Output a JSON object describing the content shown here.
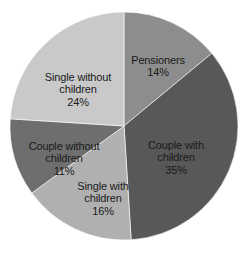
{
  "chart_data": {
    "type": "pie",
    "title": "",
    "subtitle": "",
    "xlabel": "",
    "ylabel": "",
    "legend": "none (labels placed on slices)",
    "grid": false,
    "units": "percent",
    "total": 100,
    "start_angle_deg": 0,
    "direction": "clockwise",
    "categories": [
      "Pensioners",
      "Couple with children",
      "Single with children",
      "Couple without children",
      "Single without children"
    ],
    "values": [
      14,
      35,
      16,
      11,
      24
    ],
    "slices": [
      {
        "label": "Pensioners",
        "value": 14,
        "value_text": "14%",
        "color": "#8d8d8d",
        "start_deg": 0,
        "end_deg": 50.4
      },
      {
        "label": "Couple with\nchildren",
        "label_flat": "Couple with children",
        "value": 35,
        "value_text": "35%",
        "color": "#585858",
        "start_deg": 50.4,
        "end_deg": 176.4
      },
      {
        "label": "Single with\nchildren",
        "label_flat": "Single with children",
        "value": 16,
        "value_text": "16%",
        "color": "#b0b0b0",
        "start_deg": 176.4,
        "end_deg": 234.0
      },
      {
        "label": "Couple without\nchildren",
        "label_flat": "Couple without children",
        "value": 11,
        "value_text": "11%",
        "color": "#6e6e6e",
        "start_deg": 234.0,
        "end_deg": 273.6
      },
      {
        "label": "Single without\nchildren",
        "label_flat": "Single without children",
        "value": 24,
        "value_text": "24%",
        "color": "#c9c9c9",
        "start_deg": 273.6,
        "end_deg": 360.0
      }
    ],
    "geometry": {
      "center_x": 124,
      "center_y": 126,
      "radius": 114
    },
    "background_color": "#ffffff",
    "label_text_color": "#1a1a1a"
  }
}
